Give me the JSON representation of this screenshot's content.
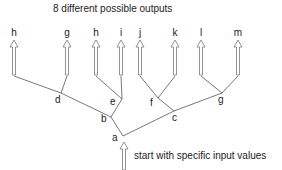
{
  "title": "8 different possible outputs",
  "caption": "start with specific input values",
  "outputs": [
    {
      "label": "h",
      "x": 14
    },
    {
      "label": "g",
      "x": 67
    },
    {
      "label": "h",
      "x": 96
    },
    {
      "label": "i",
      "x": 121
    },
    {
      "label": "j",
      "x": 140
    },
    {
      "label": "k",
      "x": 175
    },
    {
      "label": "l",
      "x": 201
    },
    {
      "label": "m",
      "x": 238
    }
  ],
  "nodes": [
    {
      "id": "a",
      "label": "a",
      "x": 123,
      "y": 136,
      "lx": 112,
      "ly": 133
    },
    {
      "id": "b",
      "label": "b",
      "x": 111,
      "y": 117,
      "lx": 101,
      "ly": 114
    },
    {
      "id": "c",
      "label": "c",
      "x": 174,
      "y": 111,
      "lx": 172,
      "ly": 113
    },
    {
      "id": "d",
      "label": "d",
      "x": 61,
      "y": 93,
      "lx": 55,
      "ly": 95
    },
    {
      "id": "e",
      "label": "e",
      "x": 122,
      "y": 99,
      "lx": 110,
      "ly": 97
    },
    {
      "id": "f",
      "label": "f",
      "x": 158,
      "y": 98,
      "lx": 150,
      "ly": 98
    },
    {
      "id": "g",
      "label": "g",
      "x": 222,
      "y": 93,
      "lx": 218,
      "ly": 95
    }
  ],
  "edges": [
    [
      14,
      76,
      61,
      93
    ],
    [
      61,
      93,
      111,
      117
    ],
    [
      67,
      76,
      61,
      93
    ],
    [
      96,
      76,
      122,
      99
    ],
    [
      121,
      76,
      122,
      99
    ],
    [
      122,
      99,
      111,
      117
    ],
    [
      111,
      117,
      123,
      136
    ],
    [
      123,
      136,
      174,
      111
    ],
    [
      140,
      76,
      158,
      98
    ],
    [
      175,
      76,
      158,
      98
    ],
    [
      158,
      98,
      174,
      111
    ],
    [
      174,
      111,
      222,
      93
    ],
    [
      201,
      76,
      222,
      93
    ],
    [
      238,
      76,
      222,
      93
    ]
  ],
  "colors": {
    "line": "#555555",
    "arrow_stroke": "#777777",
    "text": "#222222"
  }
}
